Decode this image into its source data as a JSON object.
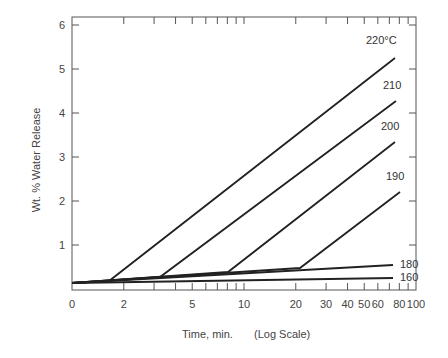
{
  "chart_data": {
    "type": "line",
    "title": "",
    "xlabel": "Time, min.",
    "xlabel_note": "(Log Scale)",
    "ylabel": "Wt. % Water Release",
    "xscale": "log",
    "xlim": [
      1,
      100
    ],
    "ylim": [
      0,
      6.2
    ],
    "x_ticks": [
      "0",
      "2",
      "5",
      "10",
      "20",
      "30",
      "40",
      "50",
      "60",
      "80",
      "100"
    ],
    "y_ticks": [
      "1",
      "2",
      "3",
      "4",
      "5",
      "6"
    ],
    "y_tick_values": [
      1,
      2,
      3,
      4,
      5,
      6
    ],
    "grid": false,
    "legend": "inline labels at line ends",
    "series": [
      {
        "name": "220°C",
        "label": "220°C",
        "points": [
          [
            1,
            0.15
          ],
          [
            1.6,
            0.2
          ],
          [
            75,
            5.25
          ]
        ]
      },
      {
        "name": "210",
        "label": "210",
        "points": [
          [
            1,
            0.15
          ],
          [
            3.2,
            0.27
          ],
          [
            75,
            4.3
          ]
        ]
      },
      {
        "name": "200",
        "label": "200",
        "points": [
          [
            1,
            0.15
          ],
          [
            7.5,
            0.38
          ],
          [
            75,
            3.35
          ]
        ]
      },
      {
        "name": "190",
        "label": "190",
        "points": [
          [
            1,
            0.15
          ],
          [
            21,
            0.45
          ],
          [
            80,
            2.2
          ]
        ]
      },
      {
        "name": "180",
        "label": "180",
        "points": [
          [
            1,
            0.15
          ],
          [
            75,
            0.55
          ]
        ]
      },
      {
        "name": "160",
        "label": "160",
        "points": [
          [
            1,
            0.15
          ],
          [
            75,
            0.25
          ]
        ]
      }
    ]
  },
  "labels": {
    "ylabel": "Wt. % Water Release",
    "xlabel": "Time, min.",
    "xnote": "(Log Scale)"
  }
}
